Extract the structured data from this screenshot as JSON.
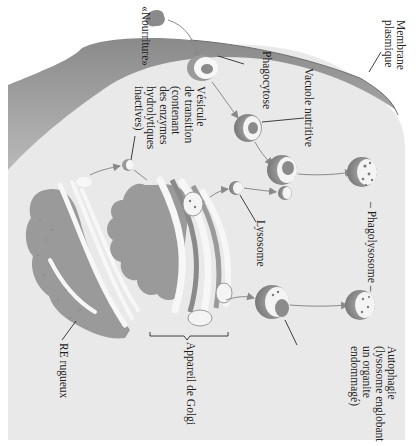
{
  "diagram": {
    "orientation": "rotated 90° clockwise (text reads top-to-bottom)",
    "colors": {
      "background": "#ffffff",
      "cytoplasm": "#e9e9e9",
      "membrane_dark": "#7a7a7a",
      "membrane_light": "#c4c4c4",
      "organelle_fill": "#9a9a9a",
      "organelle_dark": "#7d7d7d",
      "lumen": "#f7f7f7",
      "content": "#8c8c8c",
      "arrow": "#8a8a8a",
      "leader": "#2a2a2a"
    },
    "labels": {
      "food": "«Nourriture»",
      "plasma_membrane": "Membrane\nplasmique",
      "phagocytosis": "Phagocytose",
      "food_vacuole": "Vacuole nutritive",
      "transport_vesicle": "Vésicule\nde transition\n(contenant\ndes enzymes\nhydrolytiques\ninactives)",
      "lysosome": "Lysosome",
      "phagolysosome": "– Phagolysosome –",
      "autophagy": "Autophagie\n(lysosome englobant\nun organite\nendommagé)",
      "golgi": "Appareil de Golgi",
      "rough_er": "RE rugueux"
    },
    "nodes": [
      {
        "id": "food-particle",
        "label_ref": "food"
      },
      {
        "id": "phagocytic-vesicle",
        "label_ref": "phagocytosis"
      },
      {
        "id": "food-vacuole",
        "label_ref": "food_vacuole"
      },
      {
        "id": "transport-vesicle",
        "label_ref": "transport_vesicle"
      },
      {
        "id": "lysosome-small",
        "label_ref": "lysosome"
      },
      {
        "id": "phagolysosome-forming",
        "label_ref": null
      },
      {
        "id": "phagolysosome",
        "label_ref": "phagolysosome"
      },
      {
        "id": "autophagy-vesicle",
        "label_ref": "autophagy"
      },
      {
        "id": "autophagolysosome",
        "label_ref": null
      },
      {
        "id": "golgi",
        "label_ref": "golgi"
      },
      {
        "id": "rough-er",
        "label_ref": "rough_er"
      }
    ],
    "edges": [
      {
        "from": "food-particle",
        "to": "phagocytic-vesicle"
      },
      {
        "from": "phagocytic-vesicle",
        "to": "food-vacuole"
      },
      {
        "from": "food-vacuole",
        "to": "phagolysosome-forming"
      },
      {
        "from": "rough-er",
        "to": "transport-vesicle"
      },
      {
        "from": "transport-vesicle",
        "to": "golgi"
      },
      {
        "from": "golgi",
        "to": "lysosome-small"
      },
      {
        "from": "lysosome-small",
        "to": "phagolysosome-forming"
      },
      {
        "from": "phagolysosome-forming",
        "to": "phagolysosome"
      },
      {
        "from": "golgi",
        "to": "autophagy-vesicle"
      },
      {
        "from": "autophagy-vesicle",
        "to": "autophagolysosome"
      }
    ]
  }
}
